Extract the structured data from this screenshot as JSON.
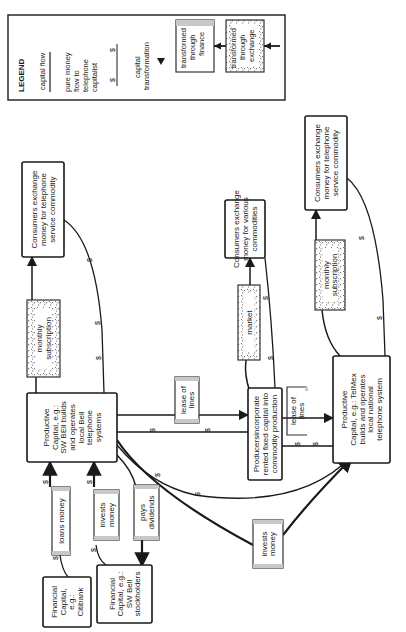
{
  "diagram": {
    "orientation": "rotated 90 degrees counter-clockwise (text reads bottom-to-top)",
    "legend": {
      "title": "LEGEND",
      "capital_flow": "capital flow",
      "pure_money_flow": [
        "pure money",
        "flow to",
        "telephone",
        "capitalist"
      ],
      "pure_money_flow_symbol": "$",
      "capital_transformation": [
        "capital",
        "transformation"
      ],
      "finance": [
        "transformed",
        "through",
        "finance"
      ],
      "exchange": [
        "transformed",
        "through",
        "exchange"
      ]
    },
    "nodes": {
      "consumers_telephone_1": [
        "Consumers exchange",
        "money for  telephone",
        "service commodity"
      ],
      "monthly_subscription_1": [
        "monthly",
        "subscription"
      ],
      "sw_bell_productive": [
        "Productive",
        "Capital, e.g.:",
        "SW BEll builds",
        "and operates",
        "local Bell",
        "telephone",
        "systems"
      ],
      "loans_money": [
        "loans money"
      ],
      "invests_money_1": [
        "invests",
        "money"
      ],
      "pays_dividends": [
        "pays",
        "dividends"
      ],
      "citibank": [
        "Financial",
        "Capital,",
        "e.g.:",
        "Citibank"
      ],
      "sw_bell_stockholders": [
        "Financial",
        "Capital, e.g.:",
        "SW Bell",
        "stockholders"
      ],
      "consumers_various": [
        "Consumers exchange",
        "money for various",
        "commodities"
      ],
      "market": [
        "market"
      ],
      "lease_of_lines_1": [
        "lease of",
        "lines"
      ],
      "producers": [
        "Producersincorporate",
        "rented fixed capital into",
        "commodity production"
      ],
      "lease_of_lines_2": [
        "lease of",
        "lines"
      ],
      "consumers_telephone_2": [
        "Consumers exchange",
        "money for  telephone",
        "service commodity"
      ],
      "monthly_subscription_2": [
        "monthly",
        "subscription"
      ],
      "telmex_productive": [
        "Productive",
        "Capital, e.g.: TelMex",
        "builds and operates",
        "local national",
        "telephone system"
      ],
      "invests_money_2": [
        "invests",
        "money"
      ]
    },
    "dollar_sign": "$"
  }
}
